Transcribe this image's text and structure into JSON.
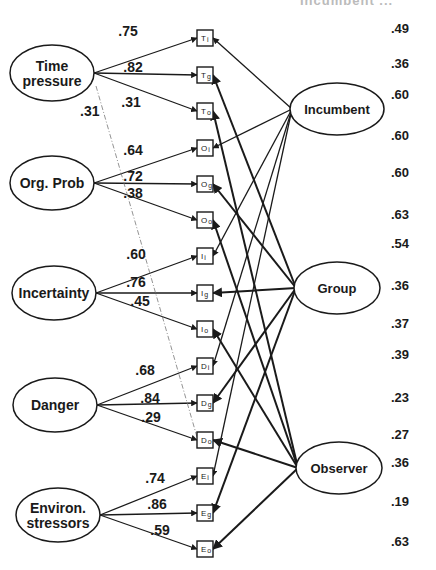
{
  "figure": {
    "top_cut_text": "Incumbent ...",
    "factors": [
      {
        "id": "T",
        "label_lines": [
          "Time",
          "pressure"
        ],
        "cx": 52,
        "cy": 73,
        "rx": 42,
        "ry": 28,
        "loadings": [
          ".75",
          ".82",
          ".31"
        ],
        "loading_pos": [
          [
            128,
            36
          ],
          [
            133,
            72
          ],
          [
            131,
            107
          ]
        ]
      },
      {
        "id": "O",
        "label_lines": [
          "Org. Prob"
        ],
        "cx": 52,
        "cy": 183,
        "rx": 42,
        "ry": 27,
        "loadings": [
          ".64",
          ".72",
          ".38"
        ],
        "loading_pos": [
          [
            133,
            155
          ],
          [
            133,
            181
          ],
          [
            133,
            198
          ]
        ]
      },
      {
        "id": "I",
        "label_lines": [
          "Incertainty"
        ],
        "cx": 54,
        "cy": 293,
        "rx": 42,
        "ry": 27,
        "loadings": [
          ".60",
          ".76",
          ".45"
        ],
        "loading_pos": [
          [
            136,
            259
          ],
          [
            136,
            287
          ],
          [
            140,
            306
          ]
        ]
      },
      {
        "id": "D",
        "label_lines": [
          "Danger"
        ],
        "cx": 55,
        "cy": 405,
        "rx": 42,
        "ry": 27,
        "loadings": [
          ".68",
          ".84",
          ".29"
        ],
        "loading_pos": [
          [
            145,
            375
          ],
          [
            150,
            403
          ],
          [
            151,
            422
          ]
        ]
      },
      {
        "id": "E",
        "label_lines": [
          "Environ.",
          "stressors"
        ],
        "cx": 58,
        "cy": 515,
        "rx": 42,
        "ry": 27,
        "loadings": [
          ".74",
          ".86",
          ".59"
        ],
        "loading_pos": [
          [
            155,
            483
          ],
          [
            157,
            509
          ],
          [
            160,
            535
          ]
        ]
      }
    ],
    "correlation": {
      "label": ".31",
      "x": 80,
      "y": 116
    },
    "indicators": [
      {
        "label": "T",
        "sub": "i",
        "y": 38
      },
      {
        "label": "T",
        "sub": "g",
        "y": 75
      },
      {
        "label": "T",
        "sub": "o",
        "y": 111
      },
      {
        "label": "O",
        "sub": "i",
        "y": 148
      },
      {
        "label": "O",
        "sub": "g",
        "y": 184
      },
      {
        "label": "O",
        "sub": "o",
        "y": 220
      },
      {
        "label": "I",
        "sub": "i",
        "y": 256
      },
      {
        "label": "I",
        "sub": "g",
        "y": 293
      },
      {
        "label": "I",
        "sub": "o",
        "y": 329
      },
      {
        "label": "D",
        "sub": "i",
        "y": 366
      },
      {
        "label": "D",
        "sub": "g",
        "y": 403
      },
      {
        "label": "D",
        "sub": "o",
        "y": 440
      },
      {
        "label": "E",
        "sub": "i",
        "y": 476
      },
      {
        "label": "E",
        "sub": "g",
        "y": 513
      },
      {
        "label": "E",
        "sub": "o",
        "y": 549
      }
    ],
    "methods": [
      {
        "id": "incumbent",
        "label": "Incumbent",
        "cx": 337,
        "cy": 109,
        "rx": 47,
        "ry": 26
      },
      {
        "id": "group",
        "label": "Group",
        "cx": 337,
        "cy": 288,
        "rx": 43,
        "ry": 26
      },
      {
        "id": "observer",
        "label": "Observer",
        "cx": 339,
        "cy": 468,
        "rx": 43,
        "ry": 26
      }
    ],
    "r_squared": [
      {
        "value": ".49",
        "y": 33
      },
      {
        "value": ".36",
        "y": 68
      },
      {
        "value": ".60",
        "y": 99
      },
      {
        "value": ".60",
        "y": 140
      },
      {
        "value": ".60",
        "y": 177
      },
      {
        "value": ".63",
        "y": 219
      },
      {
        "value": ".54",
        "y": 248
      },
      {
        "value": ".36",
        "y": 290
      },
      {
        "value": ".37",
        "y": 328
      },
      {
        "value": ".39",
        "y": 359
      },
      {
        "value": ".23",
        "y": 402
      },
      {
        "value": ".27",
        "y": 439
      },
      {
        "value": ".36",
        "y": 467
      },
      {
        "value": ".19",
        "y": 506
      },
      {
        "value": ".63",
        "y": 546
      }
    ]
  },
  "chart_data": {
    "type": "path_diagram",
    "traits": [
      "Time pressure",
      "Org. Prob",
      "Incertainty",
      "Danger",
      "Environ. stressors"
    ],
    "methods": [
      "Incumbent",
      "Group",
      "Observer"
    ],
    "indicators": [
      "Ti",
      "Tg",
      "To",
      "Oi",
      "Og",
      "Oo",
      "Ii",
      "Ig",
      "Io",
      "Di",
      "Dg",
      "Do",
      "Ei",
      "Eg",
      "Eo"
    ],
    "trait_loadings": {
      "Time pressure": {
        "Ti": 0.75,
        "Tg": 0.82,
        "To": 0.31
      },
      "Org. Prob": {
        "Oi": 0.64,
        "Og": 0.72,
        "Oo": 0.38
      },
      "Incertainty": {
        "Ii": 0.6,
        "Ig": 0.76,
        "Io": 0.45
      },
      "Danger": {
        "Di": 0.68,
        "Dg": 0.84,
        "Do": 0.29
      },
      "Environ. stressors": {
        "Ei": 0.74,
        "Eg": 0.86,
        "Eo": 0.59
      }
    },
    "trait_correlation": {
      "from": "Time pressure",
      "to": "Danger",
      "value": 0.31
    },
    "right_column_values": [
      0.49,
      0.36,
      0.6,
      0.6,
      0.6,
      0.63,
      0.54,
      0.36,
      0.37,
      0.39,
      0.23,
      0.27,
      0.36,
      0.19,
      0.63
    ]
  }
}
